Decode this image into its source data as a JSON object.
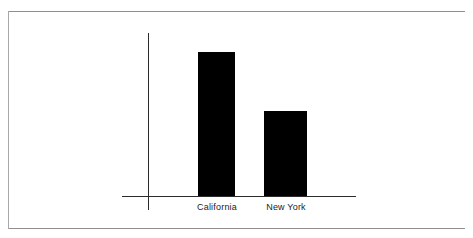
{
  "page": {
    "background_color": "#ffffff",
    "width": 473,
    "height": 238,
    "frame_color": "#8f8f8f"
  },
  "chart_data": {
    "type": "bar",
    "title": "",
    "subtitle": "",
    "xlabel": "",
    "ylabel": "",
    "categories": [
      "California",
      "New York"
    ],
    "values": [
      144,
      85
    ],
    "ylim": [
      0,
      177
    ],
    "grid": false,
    "legend": null,
    "bar_color": "#000000",
    "axis_color": "#2b2b2b",
    "tick_labels_y": [],
    "annotations": []
  },
  "axes": {
    "y_axis_name": "value-axis",
    "x_axis_name": "category-axis"
  }
}
